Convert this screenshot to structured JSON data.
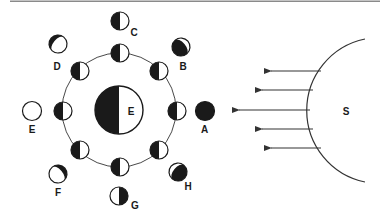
{
  "diagram": {
    "type": "moon-phases",
    "colors": {
      "dark": "#1a1a1a",
      "light": "#ffffff",
      "line": "#333333",
      "top_rule": "#888888"
    },
    "earth": {
      "label": "E"
    },
    "sun": {
      "label": "S"
    },
    "light_rays": {
      "count": 5,
      "direction": "left"
    },
    "orbit_moons": [
      {
        "position": "right",
        "phase": "first-quarter-view"
      },
      {
        "position": "upper-right",
        "phase": "first-quarter-view"
      },
      {
        "position": "top",
        "phase": "first-quarter-view"
      },
      {
        "position": "upper-left",
        "phase": "first-quarter-view"
      },
      {
        "position": "left",
        "phase": "first-quarter-view"
      },
      {
        "position": "lower-left",
        "phase": "first-quarter-view"
      },
      {
        "position": "bottom",
        "phase": "first-quarter-view"
      },
      {
        "position": "lower-right",
        "phase": "first-quarter-view"
      }
    ],
    "phase_views": [
      {
        "label": "A",
        "phase": "new-moon"
      },
      {
        "label": "B",
        "phase": "waxing-crescent"
      },
      {
        "label": "C",
        "phase": "first-quarter"
      },
      {
        "label": "D",
        "phase": "waxing-gibbous"
      },
      {
        "label": "E",
        "phase": "full-moon"
      },
      {
        "label": "F",
        "phase": "waning-gibbous"
      },
      {
        "label": "G",
        "phase": "third-quarter"
      },
      {
        "label": "H",
        "phase": "waning-crescent"
      }
    ]
  }
}
